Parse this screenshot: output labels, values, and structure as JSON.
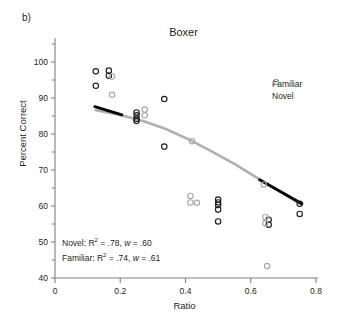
{
  "figure": {
    "panel_label": "b)",
    "title": "Boxer"
  },
  "axes": {
    "xlabel": "Ratio",
    "ylabel": "Percent Correct",
    "x_ticks": [
      "0",
      "0.2",
      "0.4",
      "0.6",
      "0.8"
    ],
    "y_ticks": [
      "40",
      "50",
      "60",
      "70",
      "80",
      "90",
      "100"
    ]
  },
  "legend": {
    "items": [
      {
        "label": "Familiar",
        "color": "#231f20",
        "marker": "open-circle-marker"
      },
      {
        "label": "Novel",
        "color": "#a9a9a9",
        "marker": "open-circle-marker"
      }
    ]
  },
  "annotations": {
    "novel_line": "Novel: R2 = .78, w = .60",
    "familiar_line": "Familiar: R2 = .74, w = .61",
    "novel_prefix": "Novel: R",
    "novel_exp": "2",
    "novel_mid": " = .78, ",
    "novel_w": "w",
    "novel_suffix": " = .60",
    "familiar_prefix": "Familiar: R",
    "familiar_exp": "2",
    "familiar_mid": " = .74, ",
    "familiar_w": "w",
    "familiar_suffix": " = .61"
  },
  "colors": {
    "familiar": "#231f20",
    "novel": "#a9a9a9",
    "axis": "#808080",
    "fit_novel": "#b0b0b0",
    "fit_familiar": "#000000"
  },
  "chart_data": {
    "type": "scatter",
    "title": "Boxer",
    "xlabel": "Ratio",
    "ylabel": "Percent Correct",
    "xlim": [
      0,
      0.8
    ],
    "ylim": [
      40,
      105
    ],
    "x_ticks": [
      0,
      0.2,
      0.4,
      0.6,
      0.8
    ],
    "y_ticks": [
      40,
      50,
      60,
      70,
      80,
      90,
      100
    ],
    "y_minor_ticks": [
      45,
      55,
      65,
      75,
      85,
      95,
      105
    ],
    "grid": false,
    "legend_position": "top-right",
    "series": [
      {
        "name": "Familiar",
        "color": "#231f20",
        "marker": "open-circle",
        "points": [
          [
            0.125,
            97.4
          ],
          [
            0.125,
            93.4
          ],
          [
            0.165,
            97.6
          ],
          [
            0.165,
            96.2
          ],
          [
            0.25,
            86.0
          ],
          [
            0.25,
            85.2
          ],
          [
            0.25,
            84.2
          ],
          [
            0.25,
            83.6
          ],
          [
            0.335,
            89.7
          ],
          [
            0.335,
            76.5
          ],
          [
            0.5,
            61.8
          ],
          [
            0.5,
            61.0
          ],
          [
            0.5,
            60.3
          ],
          [
            0.5,
            59.0
          ],
          [
            0.5,
            55.7
          ],
          [
            0.655,
            56.2
          ],
          [
            0.655,
            54.8
          ],
          [
            0.75,
            60.6
          ],
          [
            0.75,
            57.8
          ]
        ]
      },
      {
        "name": "Novel",
        "color": "#a9a9a9",
        "marker": "open-circle",
        "points": [
          [
            0.175,
            96.0
          ],
          [
            0.175,
            90.9
          ],
          [
            0.275,
            86.8
          ],
          [
            0.275,
            85.2
          ],
          [
            0.42,
            78.0
          ],
          [
            0.415,
            62.8
          ],
          [
            0.415,
            61.0
          ],
          [
            0.435,
            60.9
          ],
          [
            0.64,
            66.0
          ],
          [
            0.645,
            56.9
          ],
          [
            0.645,
            55.2
          ],
          [
            0.65,
            43.3
          ]
        ]
      }
    ],
    "fits": [
      {
        "name": "Novel fit",
        "color": "#b0b0b0",
        "type": "curve",
        "r_squared": 0.78,
        "w": 0.6,
        "x_range": [
          0.125,
          0.755
        ],
        "points": [
          [
            0.125,
            86.6
          ],
          [
            0.2,
            85.3
          ],
          [
            0.27,
            83.6
          ],
          [
            0.34,
            81.4
          ],
          [
            0.41,
            78.5
          ],
          [
            0.48,
            75.2
          ],
          [
            0.55,
            71.7
          ],
          [
            0.62,
            67.8
          ],
          [
            0.69,
            64.0
          ],
          [
            0.755,
            60.4
          ]
        ]
      },
      {
        "name": "Familiar fit",
        "color": "#000000",
        "type": "line-segments",
        "r_squared": 0.74,
        "w": 0.61,
        "segments": [
          [
            [
              0.122,
              87.6
            ],
            [
              0.205,
              85.3
            ]
          ],
          [
            [
              0.627,
              67.3
            ],
            [
              0.757,
              60.6
            ]
          ]
        ]
      }
    ]
  }
}
